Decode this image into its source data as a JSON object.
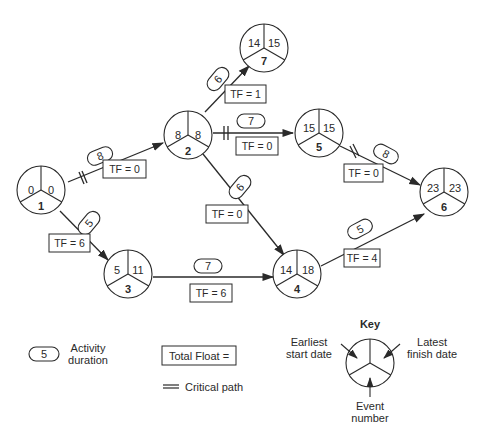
{
  "colors": {
    "line": "#2a2a2a",
    "background": "#ffffff"
  },
  "nodes": [
    {
      "id": "1",
      "event": "1",
      "earliest_start": "0",
      "latest_finish": "0",
      "cx": 45,
      "cy": 190
    },
    {
      "id": "2",
      "event": "2",
      "earliest_start": "8",
      "latest_finish": "8",
      "cx": 188,
      "cy": 165
    },
    {
      "id": "7",
      "event": "7",
      "earliest_start": "14",
      "latest_finish": "15",
      "cx": 263,
      "cy": 38
    },
    {
      "id": "5",
      "event": "5",
      "earliest_start": "15",
      "latest_finish": "15",
      "cx": 319,
      "cy": 165
    },
    {
      "id": "3",
      "event": "3",
      "earliest_start": "5",
      "latest_finish": "11",
      "cx": 128,
      "cy": 270
    },
    {
      "id": "4",
      "event": "4",
      "earliest_start": "14",
      "latest_finish": "18",
      "cx": 297,
      "cy": 270
    },
    {
      "id": "6",
      "event": "6",
      "earliest_start": "23",
      "latest_finish": "23",
      "cx": 445,
      "cy": 190
    }
  ],
  "activities": [
    {
      "from": "1",
      "to": "2",
      "duration": "8",
      "total_float": "TF = 0",
      "critical": true
    },
    {
      "from": "1",
      "to": "3",
      "duration": "5",
      "total_float": "TF = 6",
      "critical": false
    },
    {
      "from": "2",
      "to": "7",
      "duration": "6",
      "total_float": "TF = 1",
      "critical": false
    },
    {
      "from": "2",
      "to": "5",
      "duration": "7",
      "total_float": "TF = 0",
      "critical": true
    },
    {
      "from": "2",
      "to": "4",
      "duration": "6",
      "total_float": "TF = 0",
      "critical": false
    },
    {
      "from": "3",
      "to": "4",
      "duration": "7",
      "total_float": "TF = 6",
      "critical": false
    },
    {
      "from": "5",
      "to": "6",
      "duration": "8",
      "total_float": "TF = 0",
      "critical": true
    },
    {
      "from": "4",
      "to": "6",
      "duration": "5",
      "total_float": "TF = 4",
      "critical": false
    }
  ],
  "legend": {
    "duration_sample": "5",
    "duration_label_line1": "Activity",
    "duration_label_line2": "duration",
    "total_float_label": "Total Float =",
    "critical_path_label": "Critical path",
    "key_title": "Key",
    "earliest_line1": "Earliest",
    "earliest_line2": "start date",
    "latest_line1": "Latest",
    "latest_line2": "finish date",
    "event_line1": "Event",
    "event_line2": "number"
  }
}
